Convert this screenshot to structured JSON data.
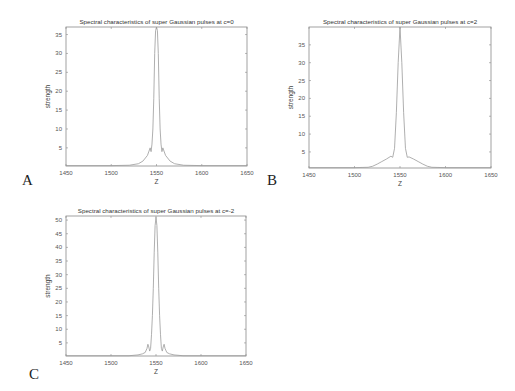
{
  "figure": {
    "panels": [
      {
        "letter": "A"
      },
      {
        "letter": "B"
      },
      {
        "letter": "C"
      }
    ]
  },
  "chart_data": [
    {
      "type": "line",
      "panel": "A",
      "title": "Spectral characteristics of super Gaussian pulses at c=0",
      "xlabel": "Z",
      "ylabel": "strength",
      "xlim": [
        1450,
        1650
      ],
      "ylim": [
        0.2,
        37
      ],
      "xticks": [
        1450,
        1500,
        1550,
        1600,
        1650
      ],
      "yticks": [
        5,
        10,
        15,
        20,
        25,
        30,
        35
      ],
      "grid": false,
      "line_color": "#9a9a9a",
      "x": [
        1450,
        1500,
        1520,
        1530,
        1535,
        1540,
        1543,
        1544,
        1545,
        1546,
        1547,
        1548,
        1549,
        1550,
        1551,
        1552,
        1553,
        1554,
        1555,
        1556,
        1557,
        1560,
        1565,
        1570,
        1580,
        1600,
        1650
      ],
      "y": [
        0.3,
        0.3,
        0.4,
        0.8,
        1.5,
        3.0,
        5.0,
        4.0,
        6.0,
        10.0,
        18.0,
        30.0,
        36.0,
        37.0,
        36.0,
        30.0,
        18.0,
        10.0,
        6.0,
        4.0,
        5.0,
        3.0,
        1.5,
        0.8,
        0.4,
        0.3,
        0.3
      ]
    },
    {
      "type": "line",
      "panel": "B",
      "title": "Spectral characteristics of super Gaussian pulses at c=2",
      "xlabel": "Z",
      "ylabel": "strength",
      "xlim": [
        1450,
        1650
      ],
      "ylim": [
        0.5,
        40
      ],
      "xticks": [
        1450,
        1500,
        1550,
        1600,
        1650
      ],
      "yticks": [
        5,
        10,
        15,
        20,
        25,
        30,
        35
      ],
      "grid": false,
      "line_color": "#9a9a9a",
      "x": [
        1450,
        1500,
        1515,
        1520,
        1525,
        1530,
        1535,
        1540,
        1542,
        1544,
        1546,
        1548,
        1550,
        1552,
        1554,
        1556,
        1558,
        1560,
        1565,
        1570,
        1575,
        1580,
        1585,
        1600,
        1650
      ],
      "y": [
        0.6,
        0.6,
        0.7,
        1.0,
        1.6,
        2.3,
        3.0,
        3.8,
        3.5,
        6.0,
        16.0,
        30.0,
        40.0,
        30.0,
        16.0,
        6.0,
        3.5,
        3.6,
        3.0,
        2.3,
        1.6,
        1.0,
        0.7,
        0.6,
        0.6
      ]
    },
    {
      "type": "line",
      "panel": "C",
      "title": "Spectral characteristics of super Gaussian pulses at c=-2",
      "xlabel": "Z",
      "ylabel": "strength",
      "xlim": [
        1450,
        1650
      ],
      "ylim": [
        0.2,
        51.5
      ],
      "xticks": [
        1450,
        1500,
        1550,
        1600,
        1650
      ],
      "yticks": [
        5,
        10,
        15,
        20,
        25,
        30,
        35,
        40,
        45,
        50
      ],
      "grid": false,
      "line_color": "#9a9a9a",
      "x": [
        1450,
        1520,
        1530,
        1535,
        1538,
        1540,
        1541,
        1542,
        1543,
        1544,
        1545,
        1546,
        1547,
        1548,
        1549,
        1550,
        1551,
        1552,
        1553,
        1554,
        1555,
        1556,
        1557,
        1558,
        1559,
        1560,
        1562,
        1565,
        1570,
        1580,
        1650
      ],
      "y": [
        0.3,
        0.3,
        0.6,
        1.0,
        1.5,
        3.0,
        4.5,
        3.5,
        2.0,
        3.0,
        8.0,
        15.0,
        25.0,
        38.0,
        48.0,
        51.0,
        48.0,
        38.0,
        25.0,
        15.0,
        8.0,
        3.0,
        2.0,
        3.5,
        4.5,
        3.0,
        1.5,
        1.0,
        0.6,
        0.3,
        0.3
      ]
    }
  ]
}
